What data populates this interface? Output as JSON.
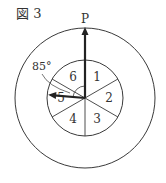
{
  "figure": {
    "title": "図 3",
    "arrow_label": "P",
    "angle_label": "85°",
    "angle_deg": 85,
    "sectors": [
      "1",
      "2",
      "3",
      "4",
      "5",
      "6"
    ],
    "colors": {
      "line": "#3a3a3a",
      "arrow": "#222222",
      "text": "#333333"
    }
  }
}
